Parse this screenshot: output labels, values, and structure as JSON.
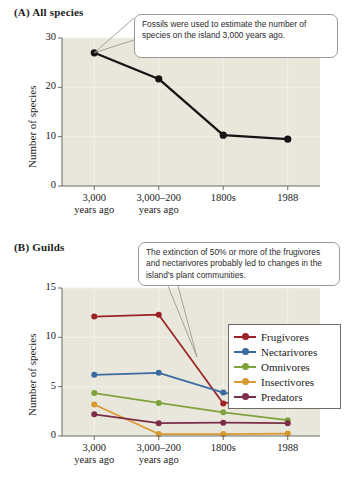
{
  "figure": {
    "panelA": {
      "title": "(A)  All species",
      "callout": "Fossils were used to estimate the number of species on the island 3,000 years ago."
    },
    "panelB": {
      "title": "(B)  Guilds",
      "callout": "The extinction of 50% or more of the frugivores and nectarivores probably led to changes in the island's plant communities."
    }
  },
  "chart_data": [
    {
      "type": "line",
      "title": "(A)  All species",
      "xlabel": "",
      "ylabel": "Number of species",
      "categories": [
        "3,000 years ago",
        "3,000–200 years ago",
        "1800s",
        "1988"
      ],
      "category_lines": [
        [
          "3,000",
          "years ago"
        ],
        [
          "3,000–200",
          "years ago"
        ],
        [
          "1800s",
          ""
        ],
        [
          "1988",
          ""
        ]
      ],
      "values": [
        27,
        21.7,
        10.3,
        9.5
      ],
      "ylim": [
        0,
        30
      ],
      "yticks": [
        0,
        10,
        20,
        30
      ],
      "grid": true,
      "legend": "none",
      "series_color": "#141414",
      "annotations": [
        "Fossils were used to estimate the number of species on the island 3,000 years ago."
      ]
    },
    {
      "type": "line",
      "title": "(B)  Guilds",
      "xlabel": "",
      "ylabel": "Number of species",
      "categories": [
        "3,000 years ago",
        "3,000–200 years ago",
        "1800s",
        "1988"
      ],
      "category_lines": [
        [
          "3,000",
          "years ago"
        ],
        [
          "3,000–200",
          "years ago"
        ],
        [
          "1800s",
          ""
        ],
        [
          "1988",
          ""
        ]
      ],
      "ylim": [
        0,
        15
      ],
      "yticks": [
        0,
        5,
        10,
        15
      ],
      "grid": true,
      "legend": "upper right",
      "series": [
        {
          "name": "Frugivores",
          "values": [
            12.1,
            12.3,
            3.3,
            4.3
          ],
          "color": "#9b2226"
        },
        {
          "name": "Nectarivores",
          "values": [
            6.2,
            6.4,
            4.4,
            3.2
          ],
          "color": "#3b6aa0"
        },
        {
          "name": "Omnivores",
          "values": [
            4.35,
            3.35,
            2.4,
            1.6
          ],
          "color": "#7fa33c"
        },
        {
          "name": "Insectivores",
          "values": [
            3.2,
            0.2,
            0.2,
            0.25
          ],
          "color": "#d89a2e"
        },
        {
          "name": "Predators",
          "values": [
            2.2,
            1.3,
            1.35,
            1.3
          ],
          "color": "#7b2e46"
        }
      ],
      "annotations": [
        "The extinction of 50% or more of the frugivores and nectarivores probably led to changes in the island's plant communities."
      ]
    }
  ]
}
